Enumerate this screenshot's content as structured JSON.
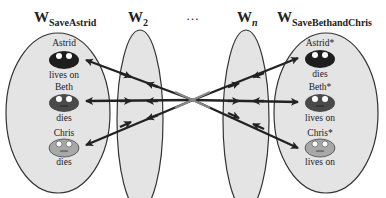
{
  "worlds": [
    {
      "id": "w-save-astrid",
      "label_main": "W",
      "label_sub": "SaveAstrid",
      "people": [
        {
          "name": "Astrid",
          "fate": "lives on",
          "face": "dark"
        },
        {
          "name": "Beth",
          "fate": "dies",
          "face": "medium"
        },
        {
          "name": "Chris",
          "fate": "dies",
          "face": "light"
        }
      ]
    },
    {
      "id": "w-2",
      "label_main": "W",
      "label_sub": "2"
    },
    {
      "id": "ellipsis",
      "label_main": "…"
    },
    {
      "id": "w-n",
      "label_main": "W",
      "label_sub": "n"
    },
    {
      "id": "w-save-beth-and-chris",
      "label_main": "W",
      "label_sub": "SaveBethandChris",
      "people": [
        {
          "name": "Astrid*",
          "fate": "dies",
          "face": "dark"
        },
        {
          "name": "Beth*",
          "fate": "lives on",
          "face": "medium"
        },
        {
          "name": "Chris*",
          "fate": "lives on",
          "face": "light"
        }
      ]
    }
  ],
  "colors": {
    "ellipse_fill": "#e4e4e4",
    "ellipse_stroke": "#333333",
    "face_dark": "#1e1e1e",
    "face_medium": "#4a4a4a",
    "face_light": "#a8a8a8",
    "arrow": "#222222"
  }
}
